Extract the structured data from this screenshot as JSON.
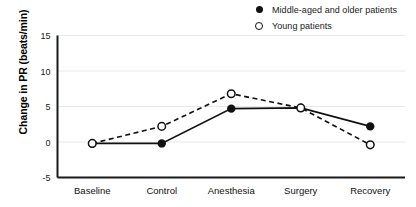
{
  "chart_data": {
    "type": "line",
    "title": "",
    "xlabel": "",
    "ylabel": "Change in PR (beats/min)",
    "categories": [
      "Baseline",
      "Control",
      "Anesthesia",
      "Surgery",
      "Recovery"
    ],
    "ylim": [
      -5,
      15
    ],
    "yticks": [
      15,
      10,
      5,
      0,
      -5
    ],
    "ytick_labels": [
      "15",
      "10",
      "5",
      "0",
      "-5"
    ],
    "grid": true,
    "legend_position": "top-right",
    "series": [
      {
        "name": "Middle-aged and older patients",
        "marker": "filled-circle",
        "line_style": "solid",
        "color": "#111111",
        "values": [
          -0.2,
          -0.2,
          4.7,
          4.8,
          2.2
        ]
      },
      {
        "name": "Young patients",
        "marker": "open-circle",
        "line_style": "dashed",
        "color": "#111111",
        "values": [
          -0.2,
          2.2,
          6.8,
          4.8,
          -0.4
        ]
      }
    ]
  },
  "legend": {
    "items": [
      {
        "label": "Middle-aged and older patients",
        "marker": "filled-circle"
      },
      {
        "label": "Young patients",
        "marker": "open-circle"
      }
    ]
  },
  "axes": {
    "y_title": "Change in PR (beats/min)",
    "y_ticks": [
      "15",
      "10",
      "5",
      "0",
      "-5"
    ],
    "x_categories": [
      "Baseline",
      "Control",
      "Anesthesia",
      "Surgery",
      "Recovery"
    ]
  }
}
